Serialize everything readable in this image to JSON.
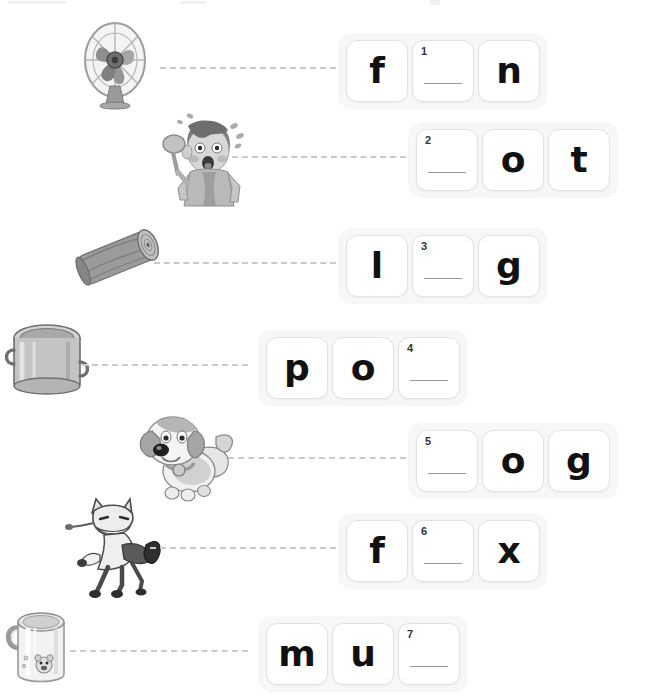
{
  "page": {
    "type": "phonics-worksheet",
    "title": "",
    "background_color": "#ffffff",
    "box_group_background": "#f7f7f7",
    "box_background": "#ffffff",
    "box_border_color": "#e2e2e2",
    "connector_color": "#c9c9c9",
    "glyph_color": "#111111"
  },
  "rows": [
    {
      "number": "1",
      "picture": "fan-icon",
      "picture_label": "electric desk fan",
      "cells": [
        {
          "kind": "letter",
          "text": "f"
        },
        {
          "kind": "blank",
          "text": "",
          "number": "1"
        },
        {
          "kind": "letter",
          "text": "n"
        }
      ]
    },
    {
      "number": "2",
      "picture": "hot-boy-icon",
      "picture_label": "boy feeling hot fanning himself",
      "cells": [
        {
          "kind": "blank",
          "text": "",
          "number": "2"
        },
        {
          "kind": "letter",
          "text": "o"
        },
        {
          "kind": "letter",
          "text": "t"
        }
      ]
    },
    {
      "number": "3",
      "picture": "log-icon",
      "picture_label": "wooden log",
      "cells": [
        {
          "kind": "letter",
          "text": "l"
        },
        {
          "kind": "blank",
          "text": "",
          "number": "3"
        },
        {
          "kind": "letter",
          "text": "g"
        }
      ]
    },
    {
      "number": "4",
      "picture": "pot-icon",
      "picture_label": "metal cooking pot",
      "cells": [
        {
          "kind": "letter",
          "text": "p"
        },
        {
          "kind": "letter",
          "text": "o"
        },
        {
          "kind": "blank",
          "text": "",
          "number": "4"
        }
      ]
    },
    {
      "number": "5",
      "picture": "dog-icon",
      "picture_label": "cartoon dog with collar",
      "cells": [
        {
          "kind": "blank",
          "text": "",
          "number": "5"
        },
        {
          "kind": "letter",
          "text": "o"
        },
        {
          "kind": "letter",
          "text": "g"
        }
      ]
    },
    {
      "number": "6",
      "picture": "fox-icon",
      "picture_label": "cartoon fox",
      "cells": [
        {
          "kind": "letter",
          "text": "f"
        },
        {
          "kind": "blank",
          "text": "",
          "number": "6"
        },
        {
          "kind": "letter",
          "text": "x"
        }
      ]
    },
    {
      "number": "7",
      "picture": "mug-icon",
      "picture_label": "mug with bear face",
      "cells": [
        {
          "kind": "letter",
          "text": "m"
        },
        {
          "kind": "letter",
          "text": "u"
        },
        {
          "kind": "blank",
          "text": "",
          "number": "7"
        }
      ]
    }
  ]
}
